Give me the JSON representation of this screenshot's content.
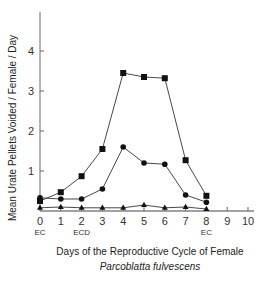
{
  "chart_data": {
    "type": "line",
    "title": "",
    "subtitle": "Parcoblatta fulvescens",
    "xlabel": "Days of the Reproductive Cycle of Female",
    "ylabel": "Mean Urate Pellets Voided / Female / Day",
    "x": [
      0,
      1,
      2,
      3,
      4,
      5,
      6,
      7,
      8
    ],
    "xlim": [
      0,
      10
    ],
    "ylim": [
      0,
      5
    ],
    "x_ticks": [
      "0",
      "1",
      "2",
      "3",
      "4",
      "5",
      "6",
      "7",
      "8",
      "9",
      "10"
    ],
    "y_ticks": [
      "1",
      "2",
      "3",
      "4"
    ],
    "x_annotations": [
      {
        "x": 0,
        "text": "EC"
      },
      {
        "x": 2,
        "text": "ECD"
      },
      {
        "x": 8,
        "text": "EC"
      }
    ],
    "grid": false,
    "legend": "none",
    "series": [
      {
        "name": "squares",
        "marker": "square",
        "values": [
          0.25,
          0.47,
          0.87,
          1.55,
          3.45,
          3.35,
          3.32,
          1.27,
          0.38
        ]
      },
      {
        "name": "circles",
        "marker": "circle",
        "values": [
          0.33,
          0.3,
          0.3,
          0.55,
          1.6,
          1.2,
          1.17,
          0.4,
          0.22
        ]
      },
      {
        "name": "triangles",
        "marker": "triangle",
        "values": [
          0.08,
          0.1,
          0.08,
          0.08,
          0.08,
          0.15,
          0.08,
          0.1,
          0.05
        ]
      }
    ]
  }
}
